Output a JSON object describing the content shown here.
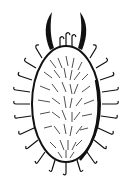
{
  "figure": {
    "style": "black ink line art on white",
    "colors": {
      "ink": "#111111",
      "background": "#ffffff"
    }
  }
}
